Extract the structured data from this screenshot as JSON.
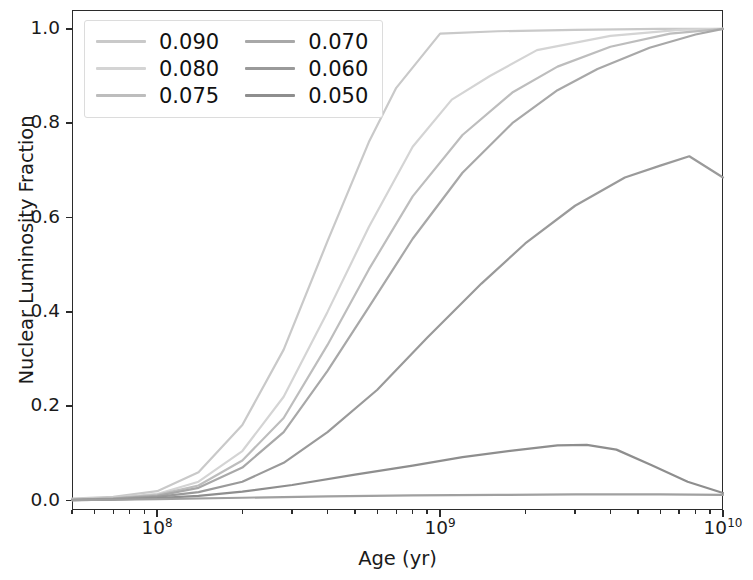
{
  "chart_data": {
    "type": "line",
    "title": "",
    "xlabel": "Age (yr)",
    "ylabel": "Nuclear Luminosity Fraction",
    "xscale": "log",
    "yscale": "linear",
    "xlim": [
      50000000,
      10000000000
    ],
    "ylim": [
      -0.02,
      1.04
    ],
    "yticks": [
      "0.0",
      "0.2",
      "0.4",
      "0.6",
      "0.8",
      "1.0"
    ],
    "ytick_values": [
      0.0,
      0.2,
      0.4,
      0.6,
      0.8,
      1.0
    ],
    "xticks": [
      "10^8",
      "10^9",
      "10^10"
    ],
    "xtick_values": [
      100000000,
      1000000000,
      10000000000
    ],
    "grid": false,
    "legend_position": "upper left",
    "legend_columns": 2,
    "series": [
      {
        "name": "0.090",
        "color": "#c9c9c9",
        "x": [
          50000000,
          70000000,
          100000000,
          140000000,
          200000000,
          280000000,
          400000000,
          560000000,
          700000000,
          1000000000,
          1600000000,
          3000000000,
          6000000000,
          10000000000
        ],
        "y": [
          0.004,
          0.008,
          0.02,
          0.06,
          0.16,
          0.32,
          0.55,
          0.76,
          0.875,
          0.99,
          0.995,
          0.998,
          1.0,
          1.0
        ]
      },
      {
        "name": "0.080",
        "color": "#d4d4d4",
        "x": [
          50000000,
          70000000,
          100000000,
          140000000,
          200000000,
          280000000,
          400000000,
          560000000,
          800000000,
          1100000000,
          1500000000,
          2200000000,
          4000000000,
          7000000000,
          10000000000
        ],
        "y": [
          0.003,
          0.006,
          0.014,
          0.04,
          0.105,
          0.22,
          0.4,
          0.58,
          0.75,
          0.85,
          0.9,
          0.955,
          0.985,
          0.998,
          1.0
        ]
      },
      {
        "name": "0.075",
        "color": "#bdbdbd",
        "x": [
          50000000,
          70000000,
          100000000,
          140000000,
          200000000,
          280000000,
          400000000,
          560000000,
          800000000,
          1200000000,
          1800000000,
          2600000000,
          4000000000,
          6500000000,
          10000000000
        ],
        "y": [
          0.002,
          0.005,
          0.012,
          0.032,
          0.085,
          0.175,
          0.33,
          0.49,
          0.645,
          0.775,
          0.865,
          0.92,
          0.962,
          0.99,
          1.0
        ]
      },
      {
        "name": "0.070",
        "color": "#a8a8a8",
        "x": [
          50000000,
          70000000,
          100000000,
          140000000,
          200000000,
          280000000,
          400000000,
          560000000,
          800000000,
          1200000000,
          1800000000,
          2600000000,
          3600000000,
          5500000000,
          8000000000,
          10000000000
        ],
        "y": [
          0.002,
          0.004,
          0.01,
          0.027,
          0.07,
          0.145,
          0.275,
          0.41,
          0.555,
          0.695,
          0.8,
          0.87,
          0.915,
          0.96,
          0.988,
          1.0
        ]
      },
      {
        "name": "0.060",
        "color": "#9a9a9a",
        "x": [
          50000000,
          70000000,
          100000000,
          140000000,
          200000000,
          280000000,
          400000000,
          600000000,
          900000000,
          1400000000,
          2000000000,
          3000000000,
          4500000000,
          6000000000,
          7600000000,
          10000000000
        ],
        "y": [
          0.001,
          0.003,
          0.008,
          0.018,
          0.04,
          0.08,
          0.145,
          0.235,
          0.345,
          0.46,
          0.545,
          0.625,
          0.685,
          0.71,
          0.73,
          0.685
        ]
      },
      {
        "name": "0.050",
        "color": "#8e8e8e",
        "x": [
          50000000,
          70000000,
          100000000,
          140000000,
          200000000,
          300000000,
          500000000,
          800000000,
          1200000000,
          1800000000,
          2600000000,
          3300000000,
          4200000000,
          5600000000,
          7500000000,
          10000000000
        ],
        "y": [
          0.001,
          0.002,
          0.005,
          0.01,
          0.019,
          0.033,
          0.055,
          0.074,
          0.092,
          0.106,
          0.117,
          0.118,
          0.108,
          0.075,
          0.04,
          0.016
        ]
      },
      {
        "name": "baseline",
        "color": "#a0a0a0",
        "hidden_from_legend": true,
        "x": [
          50000000,
          100000000,
          200000000,
          400000000,
          800000000,
          1600000000,
          3000000000,
          6000000000,
          10000000000
        ],
        "y": [
          0.001,
          0.003,
          0.006,
          0.009,
          0.011,
          0.012,
          0.013,
          0.013,
          0.012
        ]
      }
    ]
  },
  "legend": {
    "entries": [
      {
        "label": "0.090",
        "color": "#c9c9c9"
      },
      {
        "label": "0.070",
        "color": "#a8a8a8"
      },
      {
        "label": "0.080",
        "color": "#d4d4d4"
      },
      {
        "label": "0.060",
        "color": "#9a9a9a"
      },
      {
        "label": "0.075",
        "color": "#bdbdbd"
      },
      {
        "label": "0.050",
        "color": "#8e8e8e"
      }
    ]
  },
  "axes": {
    "ylabel": "Nuclear Luminosity Fraction",
    "xlabel": "Age (yr)",
    "ytick_labels": [
      "1.0",
      "0.8",
      "0.6",
      "0.4",
      "0.2",
      "0.0"
    ],
    "xtick_labels": [
      "10",
      "10",
      "10"
    ],
    "xtick_exponents": [
      "8",
      "9",
      "10"
    ]
  }
}
